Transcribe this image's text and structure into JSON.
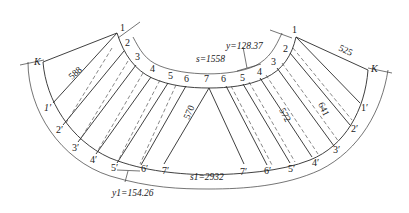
{
  "diagram": {
    "type": "developed pattern of curved transition piece",
    "left_panel": {
      "top_points": [
        "1",
        "2",
        "3",
        "4",
        "5",
        "6",
        "7"
      ],
      "bottom_points": [
        "1′",
        "2′",
        "3′",
        "4′",
        "5′",
        "6′",
        "7′"
      ],
      "corner_label": "K",
      "edge_length": "588",
      "mid_length": "570"
    },
    "right_panel": {
      "top_points": [
        "1",
        "2",
        "3",
        "4",
        "5",
        "6"
      ],
      "bottom_points": [
        "1′",
        "2′",
        "3′",
        "4′",
        "5′",
        "6′",
        "7′"
      ],
      "corner_label": "K",
      "edge_length": "525",
      "mid_length_1": "641",
      "mid_length_2": "572"
    },
    "dimensions": {
      "inner_arc": "s=1558",
      "inner_chord": "y=128.37",
      "outer_arc": "s1=2932",
      "outer_chord": "y1=154.26"
    }
  }
}
